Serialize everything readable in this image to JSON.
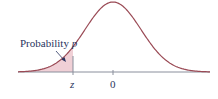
{
  "figure": {
    "type": "normal-distribution-diagram",
    "annotation": {
      "text": "Probability ",
      "variable": "p"
    },
    "axis_labels": {
      "z": "z",
      "zero": "0"
    },
    "colors": {
      "curve": "#9a4a55",
      "shade": "#f0d0d6",
      "axis": "#8a8f9c",
      "text": "#2a3560",
      "z_line": "#8a8f9c",
      "arrow": "#2a3560"
    }
  },
  "chart_data": {
    "type": "area",
    "title": "",
    "xlabel": "",
    "ylabel": "",
    "distribution": "standard normal",
    "mean": 0,
    "x_ticks": [
      "z",
      "0"
    ],
    "shaded_region": {
      "from": "-inf",
      "to": "z",
      "label": "Probability p"
    },
    "grid": false,
    "legend": "none"
  }
}
